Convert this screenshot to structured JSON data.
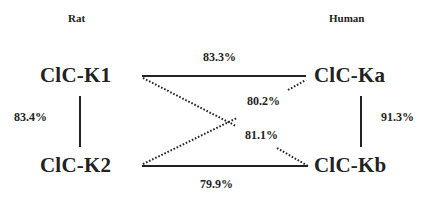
{
  "groups": {
    "left": "Rat",
    "right": "Human"
  },
  "nodes": {
    "k1": "ClC-K1",
    "k2": "ClC-K2",
    "ka": "ClC-Ka",
    "kb": "ClC-Kb"
  },
  "edges": {
    "k1_ka": {
      "label": "83.3%",
      "style": "solid"
    },
    "k2_kb": {
      "label": "79.9%",
      "style": "solid"
    },
    "k1_k2": {
      "label": "83.4%",
      "style": "solid"
    },
    "ka_kb": {
      "label": "91.3%",
      "style": "solid"
    },
    "k2_ka": {
      "label": "80.2%",
      "style": "dotted"
    },
    "k1_kb": {
      "label": "81.1%",
      "style": "dotted"
    }
  },
  "colors": {
    "ink": "#222222",
    "background": "#ffffff"
  }
}
